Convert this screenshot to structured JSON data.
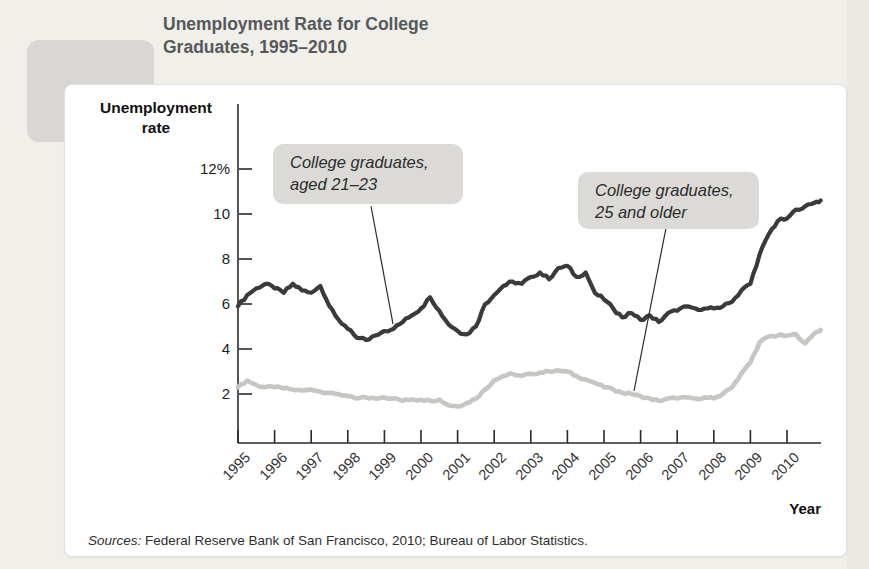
{
  "figure": {
    "label": "FIGURE",
    "number": "49-6"
  },
  "title": {
    "line1": "Unemployment Rate for College",
    "line2": "Graduates, 1995–2010"
  },
  "axes": {
    "y_title_line1": "Unemployment",
    "y_title_line2": "rate",
    "x_title": "Year"
  },
  "annotations": [
    {
      "line1": "College graduates,",
      "line2": "aged 21–23"
    },
    {
      "line1": "College graduates,",
      "line2": "25 and older"
    }
  ],
  "sources": {
    "label": "Sources:",
    "text": " Federal Reserve Bank of San Francisco, 2010; Bureau of Labor Statistics."
  },
  "colors": {
    "series_dark": "#3a3a3a",
    "series_light": "#c7c6c3",
    "axis": "#2a2a2a",
    "annotation_bg": "#dbdad6",
    "badge_bg": "#d8d7d4",
    "page_bg": "#f0efe9"
  },
  "chart_data": {
    "type": "line",
    "title": "Unemployment Rate for College Graduates, 1995–2010",
    "xlabel": "Year",
    "ylabel": "Unemployment rate",
    "xlim": [
      1995,
      2011
    ],
    "ylim": [
      0,
      13
    ],
    "grid": false,
    "legend": "inline-annotations",
    "x_ticks": [
      "1995",
      "1996",
      "1997",
      "1998",
      "1999",
      "2000",
      "2001",
      "2002",
      "2003",
      "2004",
      "2005",
      "2006",
      "2007",
      "2008",
      "2009",
      "2010"
    ],
    "y_ticks": [
      {
        "value": 12,
        "label": "12%"
      },
      {
        "value": 10,
        "label": "10"
      },
      {
        "value": 8,
        "label": "8"
      },
      {
        "value": 6,
        "label": "6"
      },
      {
        "value": 4,
        "label": "4"
      },
      {
        "value": 2,
        "label": "2"
      }
    ],
    "x": [
      1995,
      1995.25,
      1995.5,
      1995.75,
      1996,
      1996.25,
      1996.5,
      1996.75,
      1997,
      1997.25,
      1997.5,
      1997.75,
      1998,
      1998.25,
      1998.5,
      1998.75,
      1999,
      1999.25,
      1999.5,
      1999.75,
      2000,
      2000.25,
      2000.5,
      2000.75,
      2001,
      2001.25,
      2001.5,
      2001.75,
      2002,
      2002.25,
      2002.5,
      2002.75,
      2003,
      2003.25,
      2003.5,
      2003.75,
      2004,
      2004.25,
      2004.5,
      2004.75,
      2005,
      2005.25,
      2005.5,
      2005.75,
      2006,
      2006.25,
      2006.5,
      2006.75,
      2007,
      2007.25,
      2007.5,
      2007.75,
      2008,
      2008.25,
      2008.5,
      2008.75,
      2009,
      2009.25,
      2009.5,
      2009.75,
      2010,
      2010.25,
      2010.5,
      2010.75,
      2010.92
    ],
    "series": [
      {
        "name": "College graduates, aged 21–23",
        "color": "#3a3a3a",
        "values": [
          5.9,
          6.4,
          6.7,
          6.9,
          6.7,
          6.5,
          6.9,
          6.6,
          6.5,
          6.8,
          5.9,
          5.3,
          4.9,
          4.5,
          4.4,
          4.6,
          4.8,
          4.9,
          5.2,
          5.5,
          5.8,
          6.3,
          5.7,
          5.1,
          4.8,
          4.65,
          5.0,
          6.0,
          6.4,
          6.8,
          7.0,
          6.9,
          7.2,
          7.4,
          7.1,
          7.6,
          7.7,
          7.2,
          7.4,
          6.5,
          6.2,
          5.8,
          5.4,
          5.6,
          5.3,
          5.5,
          5.2,
          5.6,
          5.7,
          5.9,
          5.8,
          5.8,
          5.8,
          5.9,
          6.1,
          6.6,
          6.9,
          8.2,
          9.1,
          9.7,
          9.8,
          10.2,
          10.35,
          10.5,
          10.6
        ]
      },
      {
        "name": "College graduates, 25 and older",
        "color": "#c7c6c3",
        "values": [
          2.3,
          2.6,
          2.4,
          2.3,
          2.3,
          2.25,
          2.2,
          2.15,
          2.2,
          2.1,
          2.05,
          2.0,
          1.9,
          1.8,
          1.85,
          1.8,
          1.85,
          1.8,
          1.7,
          1.75,
          1.75,
          1.7,
          1.75,
          1.5,
          1.45,
          1.6,
          1.8,
          2.2,
          2.6,
          2.8,
          2.9,
          2.8,
          2.9,
          2.95,
          3.0,
          3.05,
          3.0,
          2.8,
          2.65,
          2.5,
          2.3,
          2.2,
          2.05,
          2.0,
          1.9,
          1.8,
          1.7,
          1.8,
          1.8,
          1.85,
          1.8,
          1.85,
          1.8,
          2.0,
          2.3,
          2.9,
          3.4,
          4.3,
          4.55,
          4.6,
          4.6,
          4.65,
          4.25,
          4.7,
          4.85
        ]
      }
    ]
  }
}
